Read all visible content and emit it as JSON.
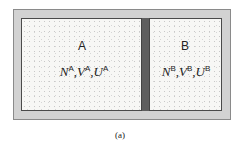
{
  "figure": {
    "caption": "(a)",
    "subsystems": [
      {
        "label": "A",
        "variables": [
          {
            "symbol": "N",
            "superscript": "A"
          },
          {
            "symbol": "V",
            "superscript": "A"
          },
          {
            "symbol": "U",
            "superscript": "A"
          }
        ]
      },
      {
        "label": "B",
        "variables": [
          {
            "symbol": "N",
            "superscript": "B"
          },
          {
            "symbol": "V",
            "superscript": "B"
          },
          {
            "symbol": "U",
            "superscript": "B"
          }
        ]
      }
    ],
    "separator": ",",
    "colors": {
      "outer_frame": "#d2d2d2",
      "chamber_fill": "#f7f7f5",
      "partition_wall": "#5e5e5e",
      "text": "#222222"
    }
  }
}
